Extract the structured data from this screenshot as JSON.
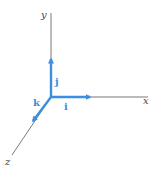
{
  "diagram": {
    "axes": {
      "x": {
        "label": "x"
      },
      "y": {
        "label": "y"
      },
      "z": {
        "label": "z"
      }
    },
    "unit_vectors": {
      "i": {
        "label": "i"
      },
      "j": {
        "label": "j"
      },
      "k": {
        "label": "k"
      }
    },
    "colors": {
      "axis": "#555555",
      "vector": "#3b8fe0"
    }
  }
}
